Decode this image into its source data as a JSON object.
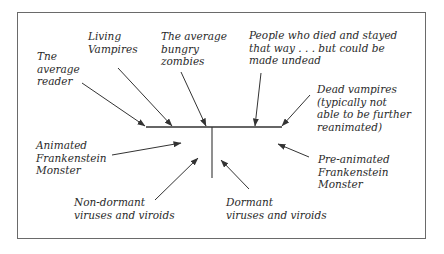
{
  "diagram": {
    "labels": {
      "average_reader": "Tne\naverage\nreader",
      "living_vampires": "Living\nVampires",
      "hungry_zombies": "The average\nbungry\nzombies",
      "people_died": "People who died and stayed\nthat way . . . but could be\nmade undead",
      "dead_vampires": "Dead vampires\n(typically not\nable to be further\nreanimated)",
      "animated_frankenstein": "Animated\nFrankenstein\nMonster",
      "pre_animated_frankenstein": "Pre-animated\nFrankenstein\nMonster",
      "non_dormant_viruses": "Non-dormant\nviruses and viroids",
      "dormant_viruses": "Dormant\nviruses and viroids"
    },
    "colors": {
      "line": "#333333",
      "border": "#6a6a6a",
      "text": "#2a2a2a"
    }
  }
}
